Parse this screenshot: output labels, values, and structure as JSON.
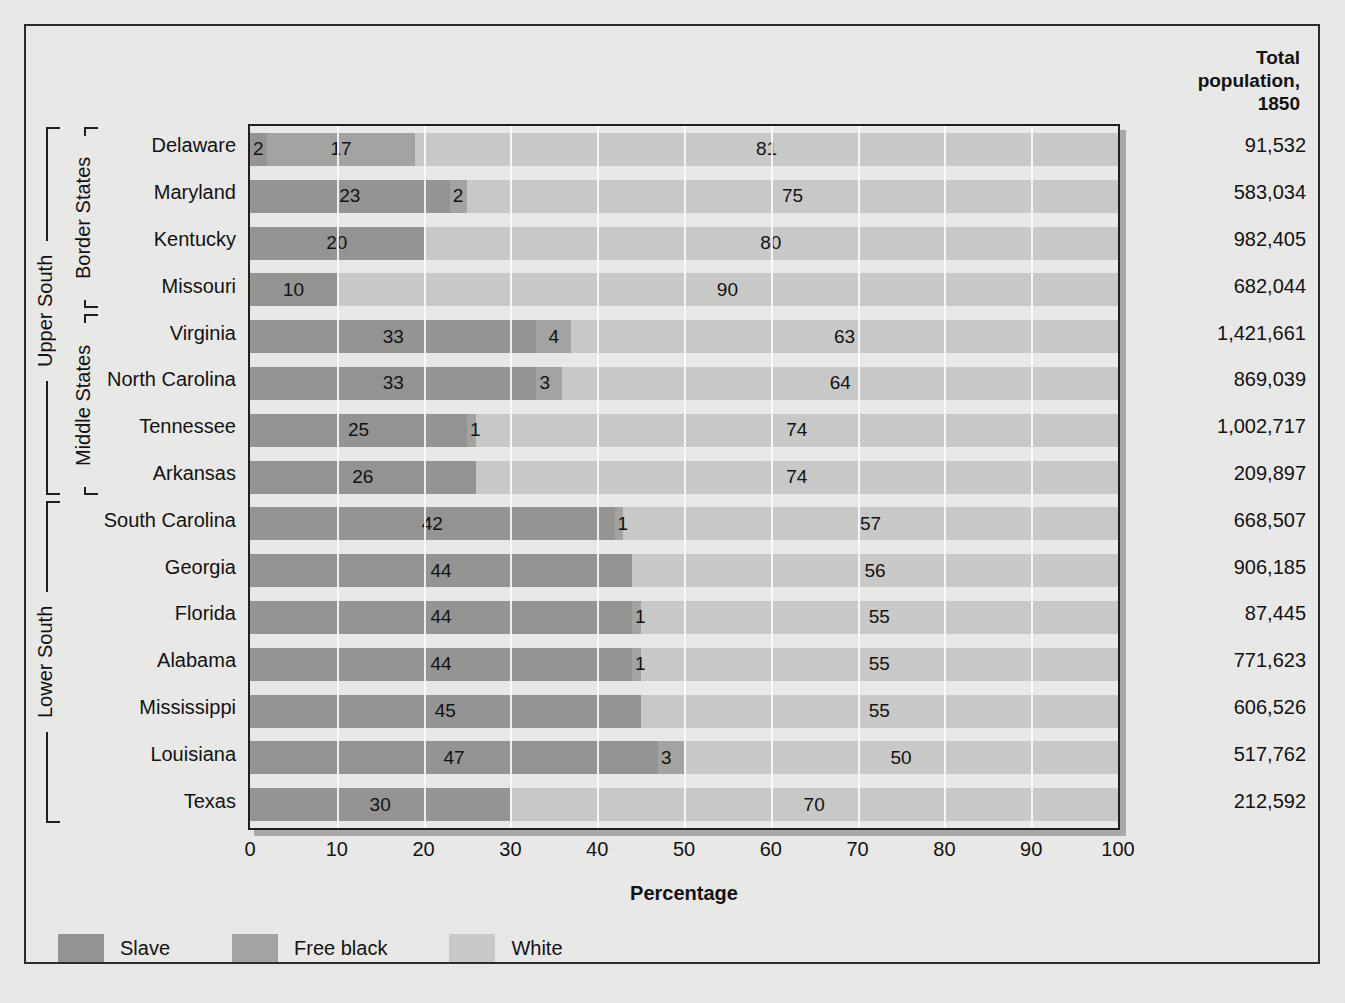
{
  "figure": {
    "population_header": "Total\npopulation,\n1850",
    "x_axis_title": "Percentage",
    "x_ticks": [
      "0",
      "10",
      "20",
      "30",
      "40",
      "50",
      "60",
      "70",
      "80",
      "90",
      "100"
    ]
  },
  "legend": {
    "items": [
      {
        "label": "Slave",
        "color": "#949492"
      },
      {
        "label": "Free black",
        "color": "#a3a3a1"
      },
      {
        "label": "White",
        "color": "#c9c9c7"
      }
    ]
  },
  "groups": [
    {
      "label": "Upper South",
      "first_row": 0,
      "last_row": 7
    },
    {
      "label": "Border States",
      "first_row": 0,
      "last_row": 3
    },
    {
      "label": "Middle States",
      "first_row": 4,
      "last_row": 7
    },
    {
      "label": "Lower South",
      "first_row": 8,
      "last_row": 14
    }
  ],
  "chart_data": {
    "type": "bar",
    "subtype": "stacked-horizontal-100",
    "title": "",
    "xlabel": "Percentage",
    "ylabel": "",
    "xlim": [
      0,
      100
    ],
    "grid": "vertical-white-gridlines-every-10",
    "legend_position": "bottom-left",
    "categories": [
      "Delaware",
      "Maryland",
      "Kentucky",
      "Missouri",
      "Virginia",
      "North Carolina",
      "Tennessee",
      "Arkansas",
      "South Carolina",
      "Georgia",
      "Florida",
      "Alabama",
      "Mississippi",
      "Louisiana",
      "Texas"
    ],
    "series": [
      {
        "name": "Slave",
        "color": "#949492",
        "values": [
          2,
          23,
          20,
          10,
          33,
          33,
          25,
          26,
          42,
          44,
          44,
          44,
          45,
          47,
          30
        ]
      },
      {
        "name": "Free black",
        "color": "#a3a3a1",
        "values": [
          17,
          2,
          0,
          0,
          4,
          3,
          1,
          0,
          1,
          0,
          1,
          1,
          0,
          3,
          0
        ]
      },
      {
        "name": "White",
        "color": "#c9c9c7",
        "values": [
          81,
          75,
          80,
          90,
          63,
          64,
          74,
          74,
          57,
          56,
          55,
          55,
          55,
          50,
          70
        ]
      }
    ],
    "total_population_1850": [
      "91,532",
      "583,034",
      "982,405",
      "682,044",
      "1,421,661",
      "869,039",
      "1,002,717",
      "209,897",
      "668,507",
      "906,185",
      "87,445",
      "771,623",
      "606,526",
      "517,762",
      "212,592"
    ]
  }
}
